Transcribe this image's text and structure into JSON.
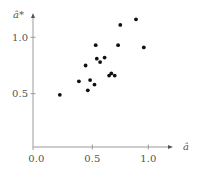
{
  "chart_data": {
    "type": "scatter",
    "title": "",
    "xlabel": "â",
    "ylabel": "â*",
    "xlim": [
      0.0,
      1.2
    ],
    "ylim": [
      0.0,
      1.2
    ],
    "grid": false,
    "legend": null,
    "x_ticks": [
      {
        "value": 0.0,
        "label": "0.0"
      },
      {
        "value": 0.5,
        "label": "0.5"
      },
      {
        "value": 1.0,
        "label": "1.0"
      }
    ],
    "y_ticks": [
      {
        "value": 0.5,
        "label": "0.5"
      },
      {
        "value": 1.0,
        "label": "1.0"
      }
    ],
    "series": [
      {
        "name": "points",
        "color": "#111111",
        "x": [
          0.21,
          0.38,
          0.46,
          0.48,
          0.52,
          0.44,
          0.53,
          0.54,
          0.57,
          0.61,
          0.65,
          0.67,
          0.7,
          0.73,
          0.75,
          0.89,
          0.96
        ],
        "y": [
          0.49,
          0.61,
          0.53,
          0.62,
          0.58,
          0.75,
          0.93,
          0.81,
          0.78,
          0.82,
          0.66,
          0.68,
          0.66,
          0.93,
          1.11,
          1.16,
          0.91
        ]
      }
    ]
  },
  "style": {
    "axis_color": "#9a9a9a",
    "text_color": "#555555",
    "point_color": "#111111"
  }
}
